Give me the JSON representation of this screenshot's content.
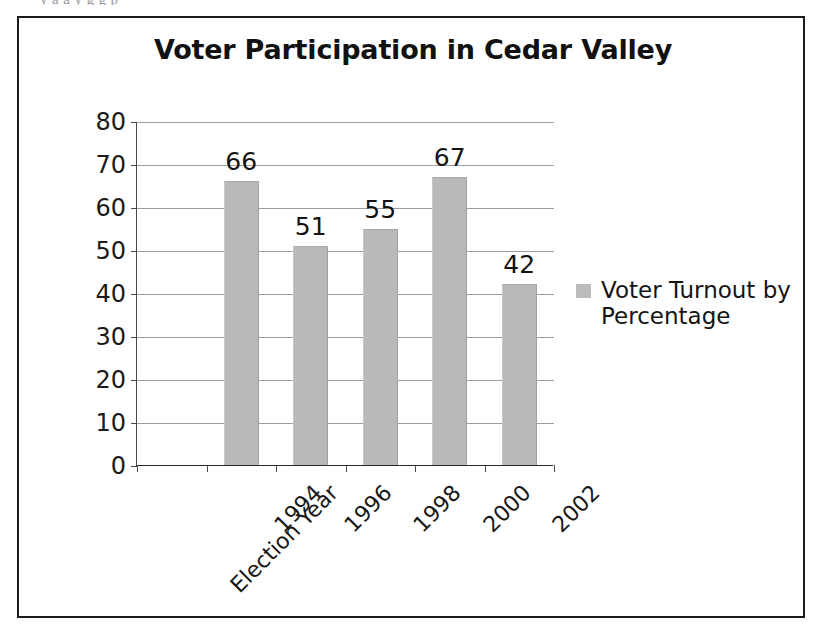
{
  "page": {
    "top_cut_text": "y  a  a  y          g  g  p"
  },
  "figure": {
    "legend": {
      "swatch_name": "series-color-swatch",
      "label": "Voter Turnout by Percentage",
      "color": "#bcbcbc"
    }
  },
  "chart_data": {
    "type": "bar",
    "title": "Voter Participation in Cedar Valley",
    "xlabel": "",
    "ylabel": "",
    "categories": [
      "Election Year",
      "1994",
      "1996",
      "1998",
      "2000",
      "2002"
    ],
    "values": [
      null,
      66,
      51,
      55,
      67,
      42
    ],
    "data_labels": [
      "",
      "66",
      "51",
      "55",
      "67",
      "42"
    ],
    "series": [
      {
        "name": "Voter Turnout by Percentage",
        "values": [
          null,
          66,
          51,
          55,
          67,
          42
        ],
        "color": "#b9b9b9"
      }
    ],
    "ylim": [
      0,
      80
    ],
    "ytick_values": [
      0,
      10,
      20,
      30,
      40,
      50,
      60,
      70,
      80
    ],
    "ytick_labels": [
      "0",
      "10",
      "20",
      "30",
      "40",
      "50",
      "60",
      "70",
      "80"
    ],
    "grid": true,
    "grid_axis": "y",
    "legend": "right",
    "legend_entries": [
      "Voter Turnout by Percentage"
    ],
    "xtick_rotation": -45,
    "frame": true
  }
}
